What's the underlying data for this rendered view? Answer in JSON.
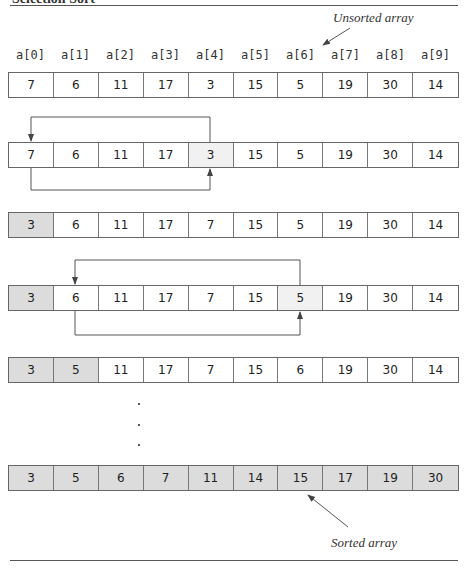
{
  "figure": {
    "title_fragment": "Selection Sort",
    "unsorted_label": "Unsorted array",
    "sorted_label": "Sorted array",
    "indices": [
      "a[0]",
      "a[1]",
      "a[2]",
      "a[3]",
      "a[4]",
      "a[5]",
      "a[6]",
      "a[7]",
      "a[8]",
      "a[9]"
    ],
    "colors": {
      "sorted_fill": "#dcdcdc",
      "swap_fill": "#f1f1f1",
      "line": "#555555"
    },
    "rows": [
      {
        "values": [
          "7",
          "6",
          "11",
          "17",
          "3",
          "15",
          "5",
          "19",
          "30",
          "14"
        ],
        "sorted_count": 0,
        "highlight": []
      },
      {
        "values": [
          "7",
          "6",
          "11",
          "17",
          "3",
          "15",
          "5",
          "19",
          "30",
          "14"
        ],
        "sorted_count": 0,
        "highlight": [
          4
        ],
        "swap": [
          0,
          4
        ]
      },
      {
        "values": [
          "3",
          "6",
          "11",
          "17",
          "7",
          "15",
          "5",
          "19",
          "30",
          "14"
        ],
        "sorted_count": 1,
        "highlight": []
      },
      {
        "values": [
          "3",
          "6",
          "11",
          "17",
          "7",
          "15",
          "5",
          "19",
          "30",
          "14"
        ],
        "sorted_count": 1,
        "highlight": [
          6
        ],
        "swap": [
          1,
          6
        ]
      },
      {
        "values": [
          "3",
          "5",
          "11",
          "17",
          "7",
          "15",
          "6",
          "19",
          "30",
          "14"
        ],
        "sorted_count": 2,
        "highlight": []
      },
      {
        "values": [
          "3",
          "5",
          "6",
          "7",
          "11",
          "14",
          "15",
          "17",
          "19",
          "30"
        ],
        "sorted_count": 10,
        "highlight": []
      }
    ],
    "ellipsis": "⋮"
  }
}
